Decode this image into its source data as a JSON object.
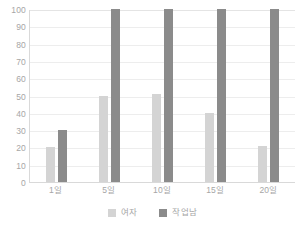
{
  "chart_data": {
    "type": "bar",
    "title": "",
    "xlabel": "",
    "ylabel": "",
    "categories": [
      "1일",
      "5일",
      "10일",
      "15일",
      "20일"
    ],
    "series": [
      {
        "name": "여자",
        "color": "#d4d4d4",
        "values": [
          20,
          50,
          51,
          40,
          21
        ]
      },
      {
        "name": "작업남",
        "color": "#8b8b8b",
        "values": [
          30,
          100,
          100,
          100,
          100
        ]
      }
    ],
    "ylim": [
      0,
      100
    ],
    "ytick_values": [
      100,
      90,
      80,
      70,
      60,
      50,
      40,
      30,
      20,
      10,
      0
    ],
    "ytick_labels": [
      "100",
      "90",
      "80",
      "70",
      "60",
      "50",
      "40",
      "30",
      "20",
      "10",
      "0"
    ],
    "grid": true,
    "grid_axis": "y",
    "legend_position": "bottom",
    "legend_entries": [
      "여자",
      "작업남"
    ],
    "axis_color": "#d9d9d9",
    "grid_color": "#ededed",
    "tick_label_color": "#a6a6a6",
    "background_color": "#ffffff"
  }
}
